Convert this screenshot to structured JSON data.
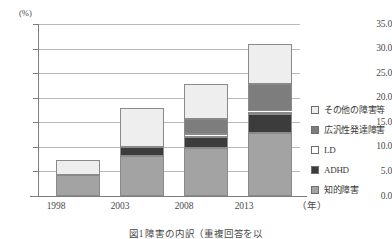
{
  "chart_data": {
    "type": "bar",
    "stacked": true,
    "title": "",
    "xlabel": "年",
    "ylabel": "(%)",
    "unit_label": "(%)",
    "categories": [
      "1998",
      "2003",
      "2008",
      "2013"
    ],
    "ylim": [
      0.0,
      35.0
    ],
    "ytick_labels": [
      "0.0",
      "5.0",
      "10.0",
      "15.0",
      "20.0",
      "25.0",
      "30.0",
      "35.0"
    ],
    "ytick_values": [
      0.0,
      5.0,
      10.0,
      15.0,
      20.0,
      25.0,
      30.0,
      35.0
    ],
    "grid": true,
    "legend_position": "right",
    "series": [
      {
        "name": "知的障害",
        "color": "#a3a3a3",
        "values": [
          4.3,
          8.2,
          9.7,
          12.8
        ]
      },
      {
        "name": "ADHD",
        "color": "#3c3c3c",
        "values": [
          0.0,
          1.8,
          2.3,
          3.8
        ]
      },
      {
        "name": "LD",
        "color": "#ffffff",
        "values": [
          0.0,
          0.0,
          0.6,
          0.6
        ]
      },
      {
        "name": "広汎性発達障害",
        "color": "#7d7d7d",
        "values": [
          0.0,
          0.0,
          3.0,
          5.6
        ]
      },
      {
        "name": "その他の障害等",
        "color": "#eeeeee",
        "values": [
          3.1,
          8.0,
          7.2,
          8.2
        ]
      }
    ],
    "totals": [
      7.4,
      18.0,
      22.8,
      31.0
    ]
  },
  "legend": {
    "items": [
      {
        "label": "その他の障害等",
        "swatch": "other-swatch"
      },
      {
        "label": "広汎性発達障害",
        "swatch": "pdd-swatch"
      },
      {
        "label": "LD",
        "swatch": "ld-swatch"
      },
      {
        "label": "ADHD",
        "swatch": "adhd-swatch"
      },
      {
        "label": "知的障害",
        "swatch": "intellectual-swatch"
      }
    ]
  },
  "caption": "図1 障害の内訳（重複回答を以"
}
